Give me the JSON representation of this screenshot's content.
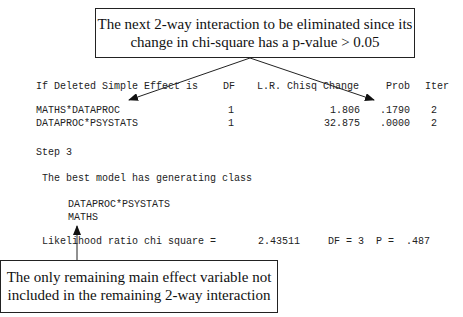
{
  "callouts": {
    "top": {
      "line1": "The next 2-way interaction to be eliminated since its",
      "line2": "change in chi-square has a p-value > 0.05"
    },
    "bottom": {
      "line1": "The only remaining main effect variable not",
      "line2": "included in the remaining 2-way interaction"
    }
  },
  "table": {
    "headers": {
      "effect": "If Deleted Simple Effect is",
      "df": "DF",
      "chisq": "L.R. Chisq Change",
      "prob": "Prob",
      "iter": "Iter"
    },
    "rows": [
      {
        "effect": "MATHS*DATAPROC",
        "df": "1",
        "chisq": "1.806",
        "prob": ".1790",
        "iter": "2"
      },
      {
        "effect": "DATAPROC*PSYSTATS",
        "df": "1",
        "chisq": "32.875",
        "prob": ".0000",
        "iter": "2"
      }
    ]
  },
  "step": "Step 3",
  "best_model": {
    "heading": "The best model has generating class",
    "terms": [
      "DATAPROC*PSYSTATS",
      "MATHS"
    ]
  },
  "likelihood": {
    "label": "Likelihood ratio chi square =",
    "value": "2.43511",
    "df": "DF = 3",
    "p": "P =  .487"
  },
  "colors": {
    "text": "#222222",
    "lines": "#222222",
    "background": "#ffffff"
  }
}
